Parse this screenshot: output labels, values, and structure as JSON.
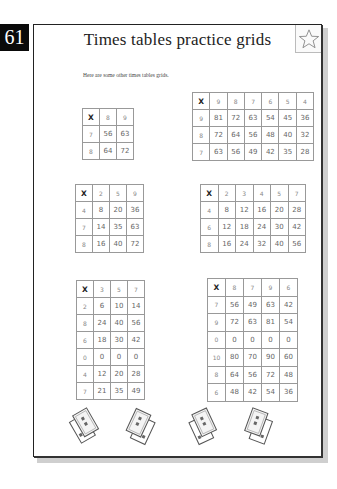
{
  "page_number": "61",
  "title": "Times tables practice grids",
  "star_icon": "star-outline-icon",
  "intro": "Here are some other times tables grids.",
  "grids": [
    {
      "corner": "X",
      "columns": [
        "8",
        "9"
      ],
      "rows": [
        {
          "header": "7",
          "cells": [
            "56",
            "63"
          ]
        },
        {
          "header": "8",
          "cells": [
            "64",
            "72"
          ]
        }
      ]
    },
    {
      "corner": "X",
      "columns": [
        "9",
        "8",
        "7",
        "6",
        "5",
        "4"
      ],
      "rows": [
        {
          "header": "9",
          "cells": [
            "81",
            "72",
            "63",
            "54",
            "45",
            "36"
          ]
        },
        {
          "header": "8",
          "cells": [
            "72",
            "64",
            "56",
            "48",
            "40",
            "32"
          ]
        },
        {
          "header": "7",
          "cells": [
            "63",
            "56",
            "49",
            "42",
            "35",
            "28"
          ]
        }
      ]
    },
    {
      "corner": "X",
      "columns": [
        "2",
        "5",
        "9"
      ],
      "rows": [
        {
          "header": "4",
          "cells": [
            "8",
            "20",
            "36"
          ]
        },
        {
          "header": "7",
          "cells": [
            "14",
            "35",
            "63"
          ]
        },
        {
          "header": "8",
          "cells": [
            "16",
            "40",
            "72"
          ]
        }
      ]
    },
    {
      "corner": "X",
      "columns": [
        "2",
        "3",
        "4",
        "5",
        "7"
      ],
      "rows": [
        {
          "header": "4",
          "cells": [
            "8",
            "12",
            "16",
            "20",
            "28"
          ]
        },
        {
          "header": "6",
          "cells": [
            "12",
            "18",
            "24",
            "30",
            "42"
          ]
        },
        {
          "header": "8",
          "cells": [
            "16",
            "24",
            "32",
            "40",
            "56"
          ]
        }
      ]
    },
    {
      "corner": "X",
      "columns": [
        "3",
        "5",
        "7"
      ],
      "rows": [
        {
          "header": "2",
          "cells": [
            "6",
            "10",
            "14"
          ]
        },
        {
          "header": "8",
          "cells": [
            "24",
            "40",
            "56"
          ]
        },
        {
          "header": "6",
          "cells": [
            "18",
            "30",
            "42"
          ]
        },
        {
          "header": "0",
          "cells": [
            "0",
            "0",
            "0"
          ]
        },
        {
          "header": "4",
          "cells": [
            "12",
            "20",
            "28"
          ]
        },
        {
          "header": "7",
          "cells": [
            "21",
            "35",
            "49"
          ]
        }
      ]
    },
    {
      "corner": "X",
      "columns": [
        "8",
        "7",
        "9",
        "6"
      ],
      "rows": [
        {
          "header": "7",
          "cells": [
            "56",
            "49",
            "63",
            "42"
          ]
        },
        {
          "header": "9",
          "cells": [
            "72",
            "63",
            "81",
            "54"
          ]
        },
        {
          "header": "0",
          "cells": [
            "0",
            "0",
            "0",
            "0"
          ]
        },
        {
          "header": "10",
          "cells": [
            "80",
            "70",
            "90",
            "60"
          ]
        },
        {
          "header": "8",
          "cells": [
            "64",
            "56",
            "72",
            "48"
          ]
        },
        {
          "header": "6",
          "cells": [
            "48",
            "42",
            "54",
            "36"
          ]
        }
      ]
    }
  ],
  "decorations": [
    "playing-cards-icon",
    "playing-cards-icon",
    "playing-cards-icon",
    "playing-cards-icon"
  ]
}
